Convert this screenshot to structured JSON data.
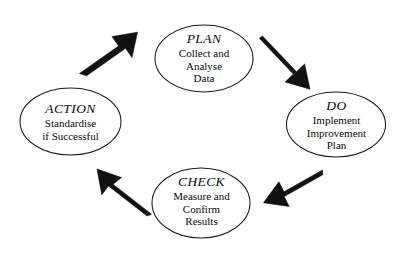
{
  "diagram": {
    "type": "cycle",
    "background_color": "#ffffff",
    "node_stroke_color": "#1a1a1a",
    "node_fill_color": "#ffffff",
    "arrow_color": "#111111",
    "text_color": "#0a0a0a",
    "nodes": [
      {
        "id": "plan",
        "heading": "PLAN",
        "body_lines": [
          "Collect and",
          "Analyse",
          "Data"
        ],
        "position": "top"
      },
      {
        "id": "do",
        "heading": "DO",
        "body_lines": [
          "Implement",
          "Improvement",
          "Plan"
        ],
        "position": "right"
      },
      {
        "id": "check",
        "heading": "CHECK",
        "body_lines": [
          "Measure and",
          "Confirm",
          "Results"
        ],
        "position": "bottom"
      },
      {
        "id": "action",
        "heading": "ACTION",
        "body_lines": [
          "Standardise",
          "if Successful"
        ],
        "position": "left"
      }
    ],
    "arrows": [
      {
        "id": "action-to-plan",
        "from": "action",
        "to": "plan",
        "direction": "up-right"
      },
      {
        "id": "plan-to-do",
        "from": "plan",
        "to": "do",
        "direction": "down-right"
      },
      {
        "id": "do-to-check",
        "from": "do",
        "to": "check",
        "direction": "down-left"
      },
      {
        "id": "check-to-action",
        "from": "check",
        "to": "action",
        "direction": "up-left"
      }
    ]
  }
}
